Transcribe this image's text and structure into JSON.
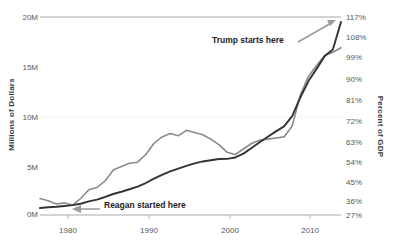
{
  "chart_data": {
    "type": "line",
    "title": "",
    "subtitle": "",
    "xlabel": "",
    "ylabel": "Millions of Dollars",
    "y2label": "Percent of GDP",
    "grid": true,
    "legend_position": "none",
    "xlim": [
      1977,
      2014
    ],
    "ylim": [
      0,
      20
    ],
    "y2lim": [
      27,
      117
    ],
    "x_ticks": [
      "1980",
      "1990",
      "2000",
      "2010"
    ],
    "x_tick_values": [
      1980,
      1990,
      2000,
      2010
    ],
    "y_ticks": [
      "0M",
      "5M",
      "10M",
      "15M",
      "20M"
    ],
    "y_tick_values": [
      0,
      5,
      10,
      15,
      20
    ],
    "y2_ticks": [
      "27%",
      "36%",
      "45%",
      "54%",
      "63%",
      "72%",
      "81%",
      "90%",
      "99%",
      "108%",
      "117%"
    ],
    "y2_tick_values": [
      27,
      36,
      45,
      54,
      63,
      72,
      81,
      90,
      99,
      108,
      117
    ],
    "series": [
      {
        "name": "Gross Federal Debt",
        "color": "#333333",
        "axis": "left",
        "x": [
          1977,
          1978,
          1979,
          1980,
          1981,
          1982,
          1983,
          1984,
          1985,
          1986,
          1987,
          1988,
          1989,
          1990,
          1991,
          1992,
          1993,
          1994,
          1995,
          1996,
          1997,
          1998,
          1999,
          2000,
          2001,
          2002,
          2003,
          2004,
          2005,
          2006,
          2007,
          2008,
          2009,
          2010,
          2011,
          2012,
          2013
        ],
        "values": [
          0.7,
          0.78,
          0.83,
          0.91,
          1.0,
          1.14,
          1.37,
          1.56,
          1.82,
          2.12,
          2.35,
          2.6,
          2.87,
          3.23,
          3.67,
          4.06,
          4.41,
          4.69,
          4.97,
          5.22,
          5.41,
          5.53,
          5.66,
          5.67,
          5.81,
          6.2,
          6.76,
          7.35,
          7.9,
          8.45,
          8.95,
          9.99,
          11.87,
          13.53,
          14.76,
          16.05,
          16.72
        ],
        "endpoint_value": 19.5
      },
      {
        "name": "Debt as Percent of GDP",
        "color": "#8a8a8a",
        "axis": "right",
        "x": [
          1977,
          1978,
          1979,
          1980,
          1981,
          1982,
          1983,
          1984,
          1985,
          1986,
          1987,
          1988,
          1989,
          1990,
          1991,
          1992,
          1993,
          1994,
          1995,
          1996,
          1997,
          1998,
          1999,
          2000,
          2001,
          2002,
          2003,
          2004,
          2005,
          2006,
          2007,
          2008,
          2009,
          2010,
          2011,
          2012,
          2013
        ],
        "values": [
          34.5,
          33.5,
          32.0,
          32.5,
          31.5,
          34.5,
          38.5,
          39.5,
          42.5,
          47.5,
          49.0,
          50.5,
          51.0,
          54.5,
          59.5,
          62.5,
          64.0,
          63.0,
          65.5,
          64.5,
          63.5,
          61.5,
          59.0,
          55.5,
          54.5,
          57.0,
          59.5,
          61.0,
          61.5,
          62.0,
          62.5,
          67.5,
          81.5,
          90.0,
          95.0,
          99.5,
          101.0
        ],
        "endpoint_value": 103.0
      }
    ],
    "annotations": [
      {
        "id": "trump-annotation",
        "text": "Trump starts here",
        "arrow": "up-right",
        "points_to": "end of gross federal debt line"
      },
      {
        "id": "reagan-annotation",
        "text": "Reagan started here",
        "arrow": "left",
        "points_to": "1981 start of both lines"
      }
    ]
  },
  "colors": {
    "debt_line": "#333333",
    "gdp_line": "#8a8a8a",
    "axis": "#bdbdbd",
    "annotation_arrow": "#9a9a9a",
    "text": "#404040"
  }
}
